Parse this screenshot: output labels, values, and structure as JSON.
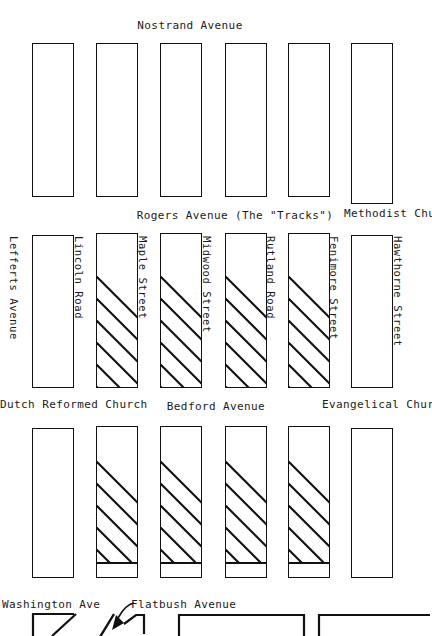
{
  "map": {
    "title_top": "Nostrand Avenue",
    "avenues": [
      {
        "name": "Nostrand Avenue",
        "position": "top"
      },
      {
        "name": "Rogers Avenue (The \"Tracks\")",
        "position": "upper-middle"
      },
      {
        "name": "Bedford Avenue",
        "position": "lower-middle"
      },
      {
        "name": "Flatbush Avenue",
        "position": "bottom"
      },
      {
        "name": "Washington Ave",
        "position": "bottom-left"
      }
    ],
    "streets": [
      {
        "name": "Lefferts Avenue",
        "column": 0
      },
      {
        "name": "Lincoln Road",
        "column": 1
      },
      {
        "name": "Maple Street",
        "column": 2
      },
      {
        "name": "Midwood Street",
        "column": 3
      },
      {
        "name": "Rutland Road",
        "column": 4
      },
      {
        "name": "Fenimore Street",
        "column": 5
      },
      {
        "name": "Hawthorne Street",
        "column": 6
      }
    ],
    "landmarks": [
      {
        "name": "Methodist Church",
        "position": "top-right"
      },
      {
        "name": "Dutch Reformed Church",
        "position": "middle-left"
      },
      {
        "name": "Evangelical Church",
        "position": "middle-right"
      }
    ],
    "rows": [
      {
        "row_id": "nostrand-to-rogers",
        "blocks": [
          {
            "index": 0,
            "hatched": false,
            "split": false
          },
          {
            "index": 1,
            "hatched": false,
            "split": false
          },
          {
            "index": 2,
            "hatched": false,
            "split": false
          },
          {
            "index": 3,
            "hatched": false,
            "split": false
          },
          {
            "index": 4,
            "hatched": false,
            "split": false
          },
          {
            "index": 5,
            "hatched": false,
            "split": false
          }
        ]
      },
      {
        "row_id": "rogers-to-bedford",
        "blocks": [
          {
            "index": 0,
            "hatched": false,
            "split": false
          },
          {
            "index": 1,
            "hatched": true,
            "split": false
          },
          {
            "index": 2,
            "hatched": true,
            "split": false
          },
          {
            "index": 3,
            "hatched": true,
            "split": false
          },
          {
            "index": 4,
            "hatched": true,
            "split": false
          },
          {
            "index": 5,
            "hatched": false,
            "split": false
          }
        ]
      },
      {
        "row_id": "bedford-to-flatbush",
        "blocks": [
          {
            "index": 0,
            "hatched": false,
            "split": false
          },
          {
            "index": 1,
            "hatched": true,
            "split": true
          },
          {
            "index": 2,
            "hatched": true,
            "split": true
          },
          {
            "index": 3,
            "hatched": true,
            "split": true
          },
          {
            "index": 4,
            "hatched": true,
            "split": true
          },
          {
            "index": 5,
            "hatched": false,
            "split": false
          }
        ]
      }
    ],
    "colors": {
      "ink": "#111111",
      "paper": "#ffffff"
    }
  }
}
